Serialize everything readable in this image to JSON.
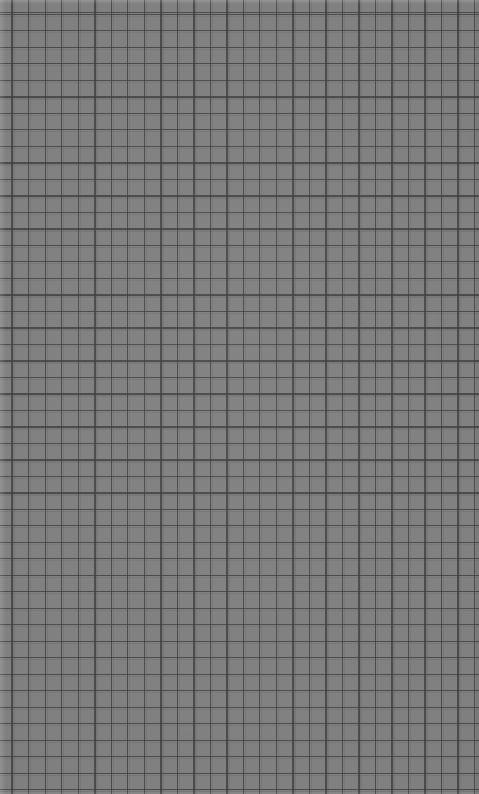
{
  "canvas": {
    "width": 479,
    "height": 794,
    "description": "Blank grid-ruled surface with no interface content",
    "background_color": "#808080",
    "line_color": "#505050"
  },
  "grid": {
    "cell_size_px": 16.5,
    "columns": 29,
    "rows": 48,
    "offset_x_px": 12,
    "offset_y_px": 14,
    "line_width_px": 1,
    "line_color": "#505050",
    "cell_color": "#808080",
    "shape": "square"
  },
  "margins": {
    "top_px": 4,
    "left_px": 6,
    "bottom_px": 3,
    "right_px": 3,
    "top_tone": "lighter",
    "left_tone": "lighter"
  },
  "texture": {
    "type": "fine-grain",
    "opacity": 0.2
  },
  "content": {
    "text_elements": [],
    "icons": [],
    "controls": [],
    "note": "No text, icons, controls, or chrome are present in the screenshot."
  }
}
